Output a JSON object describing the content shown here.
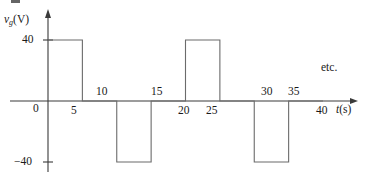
{
  "figure": {
    "background_color": "#ffffff",
    "line_color": "#555555",
    "axis_color": "#3a3a3a",
    "text_color": "#1a1a1a"
  },
  "axes": {
    "y_axis_label": "v",
    "y_axis_label_sub": "g",
    "y_axis_label_unit": "(V)",
    "x_axis_label": "t",
    "x_axis_label_unit": "(s)",
    "origin_label": "0",
    "y_tick_positive": "40",
    "y_tick_negative": "−40",
    "continuation_note": "etc."
  },
  "x_ticks_below": [
    {
      "label": "5",
      "value": 5
    },
    {
      "label": "20",
      "value": 20
    },
    {
      "label": "25",
      "value": 25
    },
    {
      "label": "40",
      "value": 40
    }
  ],
  "x_ticks_above": [
    {
      "label": "10",
      "value": 10
    },
    {
      "label": "15",
      "value": 15
    },
    {
      "label": "30",
      "value": 30
    },
    {
      "label": "35",
      "value": 35
    }
  ],
  "chart_data": {
    "type": "line",
    "title": "",
    "subtitle": "",
    "xlabel": "t(s)",
    "ylabel": "v_g(V)",
    "xlim": [
      0,
      42
    ],
    "ylim": [
      -52,
      52
    ],
    "grid": false,
    "legend": false,
    "waveform": "square wave, amplitude 40 V, period 20 s, 25% duty positive / 25% duty negative",
    "period": 20,
    "amplitude": 40,
    "annotations": [
      "etc."
    ],
    "y_tick_labels": [
      "40",
      "0",
      "−40"
    ],
    "y_tick_values": [
      40,
      0,
      -40
    ],
    "x_tick_labels": [
      "5",
      "10",
      "15",
      "20",
      "25",
      "30",
      "35",
      "40"
    ],
    "x_tick_values": [
      5,
      10,
      15,
      20,
      25,
      30,
      35,
      40
    ],
    "series": [
      {
        "name": "v_g",
        "x": [
          0,
          5,
          5,
          10,
          10,
          15,
          15,
          20,
          20,
          25,
          25,
          30,
          30,
          35,
          35,
          40
        ],
        "values": [
          40,
          40,
          0,
          0,
          -40,
          -40,
          0,
          0,
          40,
          40,
          0,
          0,
          -40,
          -40,
          0,
          0
        ]
      }
    ],
    "segments": [
      {
        "t_start": 0,
        "t_end": 5,
        "value": 40
      },
      {
        "t_start": 5,
        "t_end": 10,
        "value": 0
      },
      {
        "t_start": 10,
        "t_end": 15,
        "value": -40
      },
      {
        "t_start": 15,
        "t_end": 20,
        "value": 0
      },
      {
        "t_start": 20,
        "t_end": 25,
        "value": 40
      },
      {
        "t_start": 25,
        "t_end": 30,
        "value": 0
      },
      {
        "t_start": 30,
        "t_end": 35,
        "value": -40
      },
      {
        "t_start": 35,
        "t_end": 40,
        "value": 0
      }
    ]
  }
}
